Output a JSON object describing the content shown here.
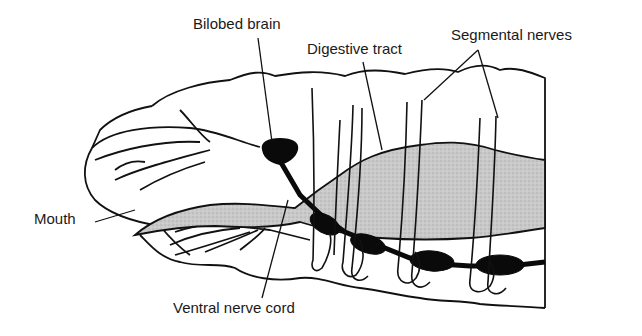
{
  "diagram": {
    "labels": {
      "brain": "Bilobed brain",
      "digestive": "Digestive tract",
      "segmental": "Segmental nerves",
      "mouth": "Mouth",
      "nerve_cord": "Ventral nerve cord"
    },
    "colors": {
      "outline": "#111111",
      "gut_fill": "#c4c4c4",
      "nerve_fill": "#0a0a0a",
      "background": "#ffffff"
    }
  }
}
